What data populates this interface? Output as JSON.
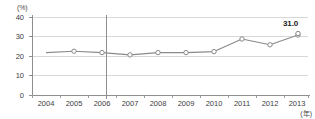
{
  "chart_data": {
    "type": "line",
    "title": "",
    "subtitle": "",
    "xlabel": "(年)",
    "ylabel": "(%)",
    "categories": [
      "2004",
      "2005",
      "2006",
      "2007",
      "2008",
      "2009",
      "2010",
      "2011",
      "2012",
      "2013"
    ],
    "values": [
      22.0,
      22.7,
      22.0,
      20.8,
      22.0,
      22.0,
      22.5,
      29.0,
      26.0,
      31.0
    ],
    "series": [
      {
        "name": "",
        "values": [
          22.0,
          22.7,
          22.0,
          20.8,
          22.0,
          22.0,
          22.5,
          29.0,
          26.0,
          31.0
        ]
      }
    ],
    "ylim": [
      0,
      40
    ],
    "yticks": [
      0,
      10,
      20,
      30,
      40
    ],
    "ytick_labels": [
      "0",
      "10",
      "20",
      "30",
      "40"
    ],
    "xtick_labels": [
      "2004",
      "2005",
      "2006",
      "2007",
      "2008",
      "2009",
      "2010",
      "2011",
      "2012",
      "2013"
    ],
    "grid": true,
    "grid_axis": "y",
    "legend": false,
    "legend_position": "none",
    "marker": "open-circle",
    "line_color": "#8a8a8a",
    "marker_color": "#8a8a8a",
    "grid_color": "#d8d8d8",
    "axis_color": "#9a9a9a",
    "annotations": [
      {
        "name": "last-point-value",
        "text": "31.0",
        "category": "2013",
        "value": 31.0,
        "bold": true
      }
    ],
    "reference_lines": [
      {
        "name": "period-divider",
        "orientation": "vertical",
        "between": [
          "2006",
          "2007"
        ],
        "color": "#8f8f8f"
      }
    ]
  },
  "axes": {
    "y_unit": "(%)",
    "x_unit": "(年)"
  }
}
